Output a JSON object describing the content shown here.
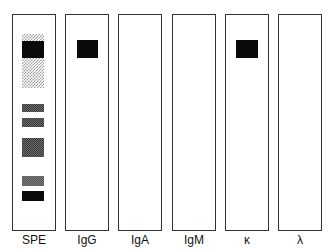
{
  "figure": {
    "type": "immunofixation electrophoresis diagram",
    "lanes": [
      {
        "label": "SPE"
      },
      {
        "label": "IgG"
      },
      {
        "label": "IgA"
      },
      {
        "label": "IgM"
      },
      {
        "label": "κ"
      },
      {
        "label": "λ"
      }
    ],
    "colors": {
      "border": "#333333",
      "band": "#0a0a0a",
      "background": "#ffffff"
    }
  }
}
